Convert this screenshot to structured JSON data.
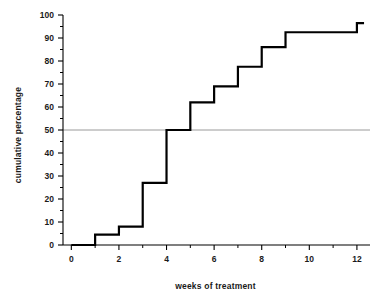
{
  "chart_data": {
    "type": "line",
    "title": "",
    "xlabel": "weeks of treatment",
    "ylabel": "cumulative percentage",
    "xlim": [
      -0.35,
      12.55
    ],
    "ylim": [
      0,
      100
    ],
    "grid": false,
    "legend": null,
    "style": "step-post cumulative distribution",
    "x_ticks_major": [
      0,
      2,
      4,
      6,
      8,
      10,
      12
    ],
    "x_ticks_minor": [
      1,
      3,
      5,
      7,
      9,
      11
    ],
    "x_tick_labels": [
      "0",
      "2",
      "4",
      "6",
      "8",
      "10",
      "12"
    ],
    "y_ticks_major": [
      0,
      10,
      20,
      30,
      40,
      50,
      60,
      70,
      80,
      90,
      100
    ],
    "y_ticks_minor": [
      5,
      15,
      25,
      35,
      45,
      55,
      65,
      75,
      85,
      95
    ],
    "y_tick_labels": [
      "0",
      "10",
      "20",
      "30",
      "40",
      "50",
      "60",
      "70",
      "80",
      "90",
      "100"
    ],
    "reference_line": {
      "axis": "y",
      "value": 50,
      "color": "#808080"
    },
    "x": [
      0,
      1,
      2,
      3,
      4,
      5,
      6,
      7,
      8,
      9,
      12,
      12.3
    ],
    "values": [
      0,
      4.5,
      8,
      27,
      50,
      62,
      69,
      77.5,
      86,
      92.5,
      96.5,
      96.5
    ],
    "series": [
      {
        "name": "cumulative percentage",
        "color": "#000000",
        "points": [
          {
            "week": 0,
            "percent": 0
          },
          {
            "week": 1,
            "percent": 4.5
          },
          {
            "week": 2,
            "percent": 8
          },
          {
            "week": 3,
            "percent": 27
          },
          {
            "week": 4,
            "percent": 50
          },
          {
            "week": 5,
            "percent": 62
          },
          {
            "week": 6,
            "percent": 69
          },
          {
            "week": 7,
            "percent": 77.5
          },
          {
            "week": 8,
            "percent": 86
          },
          {
            "week": 9,
            "percent": 92.5
          },
          {
            "week": 12,
            "percent": 96.5
          }
        ]
      }
    ]
  },
  "colors": {
    "line": "#000000",
    "axis": "#000000",
    "reference": "#9a9a9a",
    "text": "#1a1a1a",
    "background": "#ffffff"
  }
}
